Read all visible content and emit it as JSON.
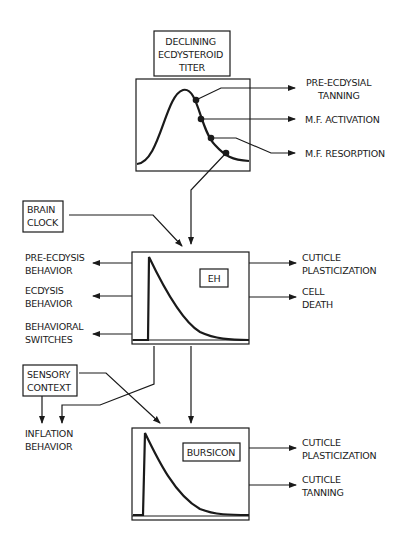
{
  "diagram": {
    "ecdysteroid": {
      "title_lines": [
        "DECLINING",
        "ECDYSTEROID",
        "TITER"
      ],
      "outputs": [
        {
          "lines": [
            "PRE-ECDYSIAL",
            "TANNING"
          ]
        },
        {
          "lines": [
            "M.F. ACTIVATION"
          ]
        },
        {
          "lines": [
            "M.F. RESORPTION"
          ]
        }
      ]
    },
    "brain_clock": {
      "lines": [
        "BRAIN",
        "CLOCK"
      ]
    },
    "eh": {
      "label": "EH",
      "left_outputs": [
        {
          "lines": [
            "PRE-ECDYSIS",
            "BEHAVIOR"
          ]
        },
        {
          "lines": [
            "ECDYSIS",
            "BEHAVIOR"
          ]
        },
        {
          "lines": [
            "BEHAVIORAL",
            "SWITCHES"
          ]
        }
      ],
      "right_outputs": [
        {
          "lines": [
            "CUTICLE",
            "PLASTICIZATION"
          ]
        },
        {
          "lines": [
            "CELL",
            "DEATH"
          ]
        }
      ]
    },
    "sensory_context": {
      "lines": [
        "SENSORY",
        "CONTEXT"
      ]
    },
    "inflation": {
      "lines": [
        "INFLATION",
        "BEHAVIOR"
      ]
    },
    "bursicon": {
      "label": "BURSICON",
      "right_outputs": [
        {
          "lines": [
            "CUTICLE",
            "PLASTICIZATION"
          ]
        },
        {
          "lines": [
            "CUTICLE",
            "TANNING"
          ]
        }
      ]
    }
  }
}
